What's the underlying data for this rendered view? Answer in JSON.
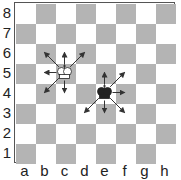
{
  "diagram": {
    "ranks": [
      "8",
      "7",
      "6",
      "5",
      "4",
      "3",
      "2",
      "1"
    ],
    "files": [
      "a",
      "b",
      "c",
      "d",
      "e",
      "f",
      "g",
      "h"
    ],
    "colors": {
      "light": "#ffffff",
      "dark": "#b4b4b4",
      "border": "#555555",
      "arrow": "#333333",
      "white_piece": "#ffffff",
      "black_piece": "#222222"
    },
    "pieces": [
      {
        "name": "white-king",
        "square": "c5",
        "color": "white",
        "arrows": [
          "b6",
          "c6",
          "d6",
          "b5",
          "b4",
          "c4"
        ]
      },
      {
        "name": "black-king",
        "square": "e4",
        "color": "black",
        "arrows": [
          "e5",
          "f5",
          "f4",
          "d3",
          "e3",
          "f3"
        ]
      }
    ]
  }
}
